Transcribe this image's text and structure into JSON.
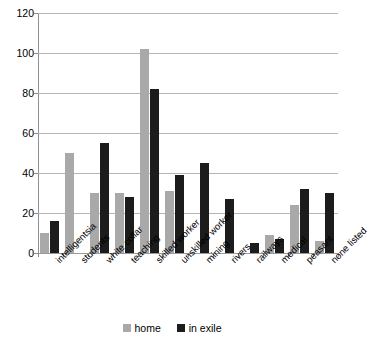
{
  "chart_data": {
    "type": "bar",
    "title": "",
    "xlabel": "",
    "ylabel": "",
    "ylim": [
      0,
      120
    ],
    "ytick_step": 20,
    "yticks": [
      0,
      20,
      40,
      60,
      80,
      100,
      120
    ],
    "grid": true,
    "legend_position": "bottom",
    "categories": [
      "intelligentsia",
      "students",
      "white collar",
      "teaching",
      "skilled worker",
      "unskilled worker",
      "mining",
      "rivers",
      "railways",
      "medical",
      "peasant",
      "none listed"
    ],
    "series": [
      {
        "name": "home",
        "color": "#a9a9a9",
        "values": [
          10,
          50,
          30,
          30,
          102,
          31,
          0,
          0,
          0,
          9,
          24,
          6
        ]
      },
      {
        "name": "in exile",
        "color": "#1c1c1c",
        "values": [
          16,
          0,
          55,
          28,
          82,
          39,
          45,
          27,
          5,
          7,
          32,
          30
        ]
      }
    ]
  },
  "legend": {
    "items": [
      {
        "label": "home",
        "swatch": "home-swatch"
      },
      {
        "label": "in exile",
        "swatch": "in-exile-swatch"
      }
    ]
  },
  "colors": {
    "home": "#a9a9a9",
    "in_exile": "#1c1c1c",
    "gridline": "#b5b5b5",
    "axis": "#8f8f8f",
    "background": "#ffffff",
    "text": "#000000"
  }
}
